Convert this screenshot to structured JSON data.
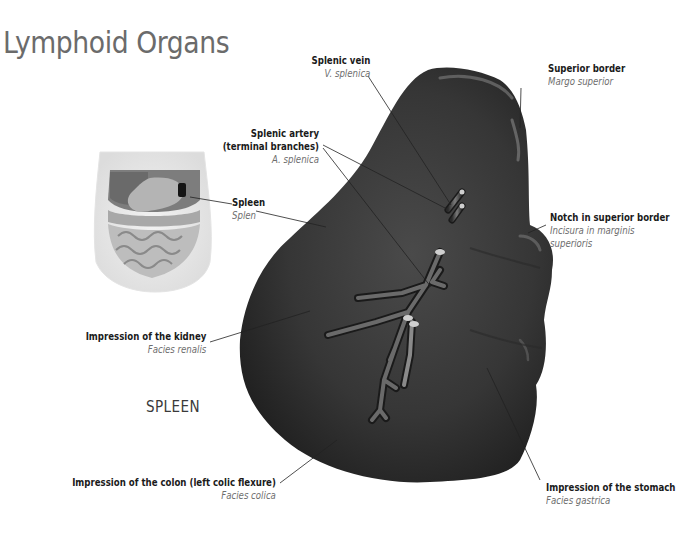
{
  "page": {
    "title": "Lymphoid Organs",
    "section_label": "SPLEEN"
  },
  "colors": {
    "title": "#6b6b6b",
    "organ_fill": "#3a3a3a",
    "organ_shadow": "#1f1f1f",
    "leader_line": "#222222",
    "latin_text": "#6e6e6e"
  },
  "labels": {
    "splenic_vein": {
      "en": "Splenic vein",
      "la": "V. splenica"
    },
    "superior_border": {
      "en": "Superior border",
      "la": "Margo superior"
    },
    "splenic_artery": {
      "en": "Splenic artery",
      "en2": "(terminal branches)",
      "la": "A. splenica"
    },
    "spleen": {
      "en": "Spleen",
      "la": "Splen"
    },
    "notch": {
      "en": "Notch in superior border",
      "la": "Incisura in marginis",
      "la2": "superioris"
    },
    "kidney": {
      "en": "Impression of the kidney",
      "la": "Facies renalis"
    },
    "colon": {
      "en": "Impression of the colon (left colic flexure)",
      "la": "Facies colica"
    },
    "stomach": {
      "en": "Impression of the stomach",
      "la": "Facies gastrica"
    }
  },
  "icons": {
    "torso_thumbnail": "torso-abdomen-icon",
    "spleen_illustration": "spleen-organ-icon"
  }
}
